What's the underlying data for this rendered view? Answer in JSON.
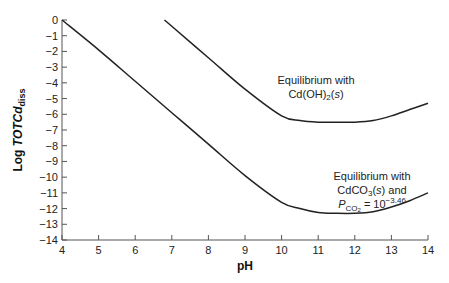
{
  "chart_data": {
    "type": "line",
    "title": "",
    "xlabel": "pH",
    "ylabel": "Log TOTCd_diss",
    "ylabel_main": "Log ",
    "ylabel_italic": "TOTCd",
    "ylabel_sub": "diss",
    "xlim": [
      4,
      14
    ],
    "ylim": [
      -14,
      0
    ],
    "x_ticks": [
      "4",
      "5",
      "6",
      "7",
      "8",
      "9",
      "10",
      "11",
      "12",
      "13",
      "14"
    ],
    "y_ticks": [
      "0",
      "−1",
      "−2",
      "−3",
      "−4",
      "−5",
      "−6",
      "−7",
      "−8",
      "−9",
      "−10",
      "−11",
      "−12",
      "−13",
      "−14"
    ],
    "grid": false,
    "series": [
      {
        "name": "Equilibrium with Cd(OH)2(s)",
        "x": [
          6.8,
          7,
          8,
          9,
          10,
          10.5,
          11,
          11.5,
          12,
          12.5,
          13,
          13.5,
          14
        ],
        "y": [
          0,
          -0.4,
          -2.4,
          -4.4,
          -6.1,
          -6.4,
          -6.5,
          -6.5,
          -6.5,
          -6.4,
          -6.1,
          -5.7,
          -5.3
        ]
      },
      {
        "name": "Equilibrium with CdCO3(s) and PCO2 = 10^-3.46",
        "x": [
          4,
          5,
          6,
          7,
          8,
          9,
          10,
          10.5,
          11,
          11.5,
          12,
          12.5,
          13,
          13.5,
          14
        ],
        "y": [
          0,
          -1.9,
          -3.9,
          -5.9,
          -7.9,
          -9.9,
          -11.6,
          -12.0,
          -12.25,
          -12.3,
          -12.3,
          -12.2,
          -11.9,
          -11.5,
          -11.0
        ]
      }
    ],
    "annotations": [
      {
        "line1": "Equilibrium with",
        "line2_pre": "Cd(OH)",
        "line2_sub": "2",
        "line2_mid": "(",
        "line2_ital": "s",
        "line2_post": ")"
      },
      {
        "line1": "Equilibrium with",
        "line2_pre": "CdCO",
        "line2_sub": "3",
        "line2_mid": "(",
        "line2_ital": "s",
        "line2_post": ") and",
        "line3_P": "P",
        "line3_sub": "CO",
        "line3_subsub": "2",
        "line3_eq": " = 10",
        "line3_exp": "−3.46"
      }
    ]
  }
}
